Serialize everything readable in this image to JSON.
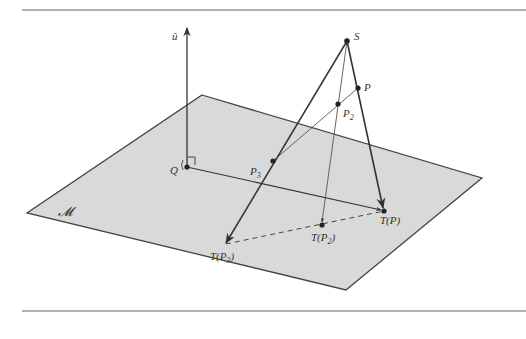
{
  "figure": {
    "colors": {
      "plane_fill": "#d9d9d9",
      "plane_edge": "#444444",
      "line": "#333333",
      "rule": "#666666",
      "background": "#ffffff"
    },
    "labels": {
      "normal": "û",
      "center": "S",
      "point_p": "P",
      "point_p2": "P",
      "point_p2_sub": "2",
      "point_p3": "P",
      "point_p3_sub": "3",
      "origin": "Q",
      "plane": "𝓜",
      "image_p": "T(P)",
      "image_p2_pre": "T(P",
      "image_p2_sub": "2",
      "image_p2_post": ")",
      "image_p3_pre": "T(P",
      "image_p3_sub": "3",
      "image_p3_post": ")"
    }
  }
}
